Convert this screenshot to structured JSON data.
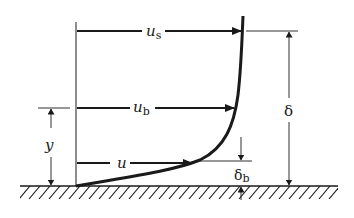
{
  "diagram": {
    "labels": {
      "u_s": {
        "base": "u",
        "sub": "s"
      },
      "u_b": {
        "base": "u",
        "sub": "b"
      },
      "u": {
        "base": "u",
        "sub": ""
      },
      "y": "y",
      "delta": "δ",
      "delta_b": {
        "base": "δ",
        "sub": "b"
      }
    },
    "colors": {
      "ink": "#1a1a1a",
      "background": "#ffffff"
    }
  }
}
